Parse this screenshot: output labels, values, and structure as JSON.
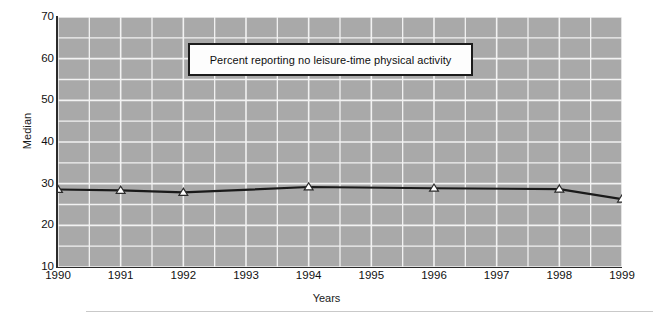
{
  "chart_data": {
    "type": "line",
    "title": "Percent reporting no leisure-time physical activity",
    "xlabel": "Years",
    "ylabel": "Median",
    "xlim": [
      1990,
      1999
    ],
    "ylim": [
      10,
      70
    ],
    "grid": true,
    "legend_position": "inside-top-center",
    "xtick_labels": [
      "1990",
      "1991",
      "1992",
      "1993",
      "1994",
      "1995",
      "1996",
      "1997",
      "1998",
      "1999"
    ],
    "ytick_labels": [
      "10",
      "20",
      "30",
      "40",
      "50",
      "60",
      "70"
    ],
    "ytick_values": [
      10,
      20,
      30,
      40,
      50,
      60,
      70
    ],
    "minor_y_step": 5,
    "marker": "triangle-open",
    "line_color": "#1a1a1a",
    "marker_face_color": "#ffffff",
    "plot_background": "#a9a9a9",
    "gridline_color": "#f2f2f2",
    "x": [
      1990,
      1991,
      1992,
      1994,
      1996,
      1998,
      1999
    ],
    "values": [
      28.6,
      28.4,
      27.9,
      29.2,
      28.9,
      28.7,
      26.3
    ],
    "series": [
      {
        "name": "Percent reporting no leisure-time physical activity",
        "points": [
          {
            "x": 1990,
            "y": 28.6
          },
          {
            "x": 1991,
            "y": 28.4
          },
          {
            "x": 1992,
            "y": 27.9
          },
          {
            "x": 1994,
            "y": 29.2
          },
          {
            "x": 1996,
            "y": 28.9
          },
          {
            "x": 1998,
            "y": 28.7
          },
          {
            "x": 1999,
            "y": 26.3
          }
        ]
      }
    ]
  }
}
